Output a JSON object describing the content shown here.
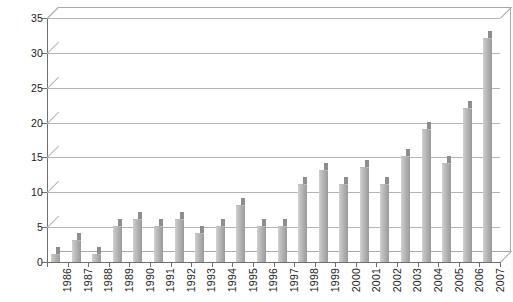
{
  "chart_data": {
    "type": "bar",
    "title": "",
    "subtitle": "",
    "xlabel": "",
    "ylabel": "",
    "categories": [
      "1986",
      "1987",
      "1988",
      "1989",
      "1990",
      "1991",
      "1992",
      "1993",
      "1994",
      "1995",
      "1996",
      "1997",
      "1998",
      "1999",
      "2000",
      "2001",
      "2002",
      "2003",
      "2004",
      "2005",
      "2006",
      "2007"
    ],
    "values": [
      1,
      3,
      1,
      5,
      6,
      5,
      6,
      4,
      5,
      8,
      5,
      5,
      11,
      13,
      11,
      13.5,
      11,
      15,
      19,
      14,
      22,
      32
    ],
    "series": [
      {
        "name": "",
        "values": [
          1,
          3,
          1,
          5,
          6,
          5,
          6,
          4,
          5,
          8,
          5,
          5,
          11,
          13,
          11,
          13.5,
          11,
          15,
          19,
          14,
          22,
          32
        ]
      }
    ],
    "ylim": [
      0,
      35
    ],
    "ytick_values": [
      0,
      5,
      10,
      15,
      20,
      25,
      30,
      35
    ],
    "ytick_labels": [
      "0",
      "5",
      "10",
      "15",
      "20",
      "25",
      "30",
      "35"
    ],
    "grid": true,
    "legend": false,
    "legend_position": "none",
    "bar_color": "#b0b0b0",
    "grid_color": "#b4b4b4",
    "axis_color": "#6e6e6e",
    "background_color": "#ffffff",
    "style_3d": true
  }
}
